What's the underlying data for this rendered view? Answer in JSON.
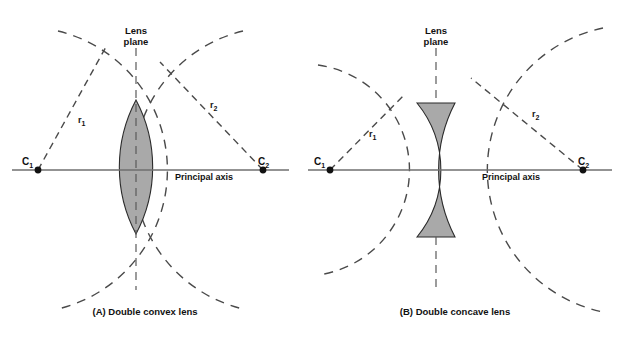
{
  "figure": {
    "background_color": "#ffffff",
    "lens_fill_color": "#a9a9a9",
    "line_color": "#4a4a4a",
    "axis_color": "#6f6f6f"
  },
  "panels": [
    {
      "id": "panel-a",
      "caption": "(A)  Double convex lens",
      "lens_plane_label_line1": "Lens",
      "lens_plane_label_line2": "plane",
      "principal_axis_label": "Principal axis",
      "center_left": {
        "symbol": "C",
        "subscript": "1"
      },
      "center_right": {
        "symbol": "C",
        "subscript": "2"
      },
      "radius_left": {
        "symbol": "r",
        "subscript": "1"
      },
      "radius_right": {
        "symbol": "r",
        "subscript": "2"
      },
      "lens_type": "double convex"
    },
    {
      "id": "panel-b",
      "caption": "(B)  Double concave lens",
      "lens_plane_label_line1": "Lens",
      "lens_plane_label_line2": "plane",
      "principal_axis_label": "Principal axis",
      "center_left": {
        "symbol": "C",
        "subscript": "1"
      },
      "center_right": {
        "symbol": "C",
        "subscript": "2"
      },
      "radius_left": {
        "symbol": "r",
        "subscript": "1"
      },
      "radius_right": {
        "symbol": "r",
        "subscript": "2"
      },
      "lens_type": "double concave"
    }
  ]
}
